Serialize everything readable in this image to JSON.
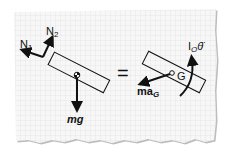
{
  "diagram": {
    "type": "free-body-diagram",
    "left": {
      "forces": [
        {
          "label_main": "N",
          "label_sub": "1",
          "direction": "upper-left"
        },
        {
          "label_main": "N",
          "label_sub": "2",
          "direction": "up-right"
        },
        {
          "label_main": "mg",
          "label_sub": "",
          "direction": "down"
        }
      ],
      "body": "tilted rectangular bar with center of mass marker"
    },
    "equals": "=",
    "right": {
      "inertial_force": {
        "label_main": "ma",
        "label_sub": "G"
      },
      "point_label": "G",
      "moment": {
        "label_main": "I",
        "label_sub": "O",
        "symbol": "θ̈"
      }
    }
  },
  "colors": {
    "paper": "#f7f7f7",
    "grid": "#dcdcdc",
    "ink": "#111111",
    "shadow": "#bdbdbd"
  }
}
